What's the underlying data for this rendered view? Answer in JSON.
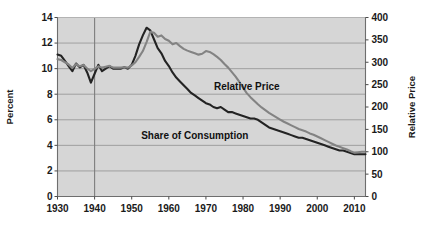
{
  "chart_data": {
    "type": "line",
    "title": "",
    "subtitle": "",
    "xlabel": "",
    "ylabel": "Percent",
    "y2label": "Relative Price",
    "xlim": [
      1930,
      2013
    ],
    "ylim": [
      0,
      14
    ],
    "y2lim": [
      0,
      400
    ],
    "grid": true,
    "legend_position": "inline-annotation",
    "background_color": "#d6d6d6",
    "plot_border_color": "#8c8c8c",
    "gridline_color": "#9a9a9a",
    "xticks": [
      1930,
      1940,
      1950,
      1960,
      1970,
      1980,
      1990,
      2000,
      2010
    ],
    "xtick_labels": [
      "1930",
      "1940",
      "1950",
      "1960",
      "1970",
      "1980",
      "1990",
      "2000",
      "2010"
    ],
    "yticks": [
      0,
      2,
      4,
      6,
      8,
      10,
      12,
      14
    ],
    "ytick_labels": [
      "0",
      "2",
      "4",
      "6",
      "8",
      "10",
      "12",
      "14"
    ],
    "y2ticks": [
      0,
      50,
      100,
      150,
      200,
      250,
      300,
      350,
      400
    ],
    "y2tick_labels": [
      "0",
      "50",
      "100",
      "150",
      "200",
      "250",
      "300",
      "350",
      "400"
    ],
    "annotations": [
      {
        "text": "Relative Price",
        "x": 1981,
        "y": 8.35,
        "color": "#111111"
      },
      {
        "text": "Share of Consumption",
        "x": 1967,
        "y": 4.5,
        "color": "#111111"
      }
    ],
    "series": [
      {
        "name": "Share of Consumption",
        "axis": "left",
        "color": "#232323",
        "width": 2.1,
        "x": [
          1930,
          1931,
          1932,
          1933,
          1934,
          1935,
          1936,
          1937,
          1938,
          1939,
          1940,
          1941,
          1942,
          1943,
          1944,
          1945,
          1946,
          1947,
          1948,
          1949,
          1950,
          1951,
          1952,
          1953,
          1954,
          1955,
          1956,
          1957,
          1958,
          1959,
          1960,
          1961,
          1962,
          1963,
          1964,
          1965,
          1966,
          1967,
          1968,
          1969,
          1970,
          1971,
          1972,
          1973,
          1974,
          1975,
          1976,
          1977,
          1978,
          1979,
          1980,
          1981,
          1982,
          1983,
          1984,
          1985,
          1986,
          1987,
          1988,
          1989,
          1990,
          1991,
          1992,
          1993,
          1994,
          1995,
          1996,
          1997,
          1998,
          1999,
          2000,
          2001,
          2002,
          2003,
          2004,
          2005,
          2006,
          2007,
          2008,
          2009,
          2010,
          2011,
          2012,
          2013
        ],
        "values": [
          11.1,
          11.0,
          10.6,
          10.2,
          9.8,
          10.4,
          10.1,
          10.3,
          9.7,
          8.9,
          9.6,
          10.3,
          9.8,
          10.0,
          10.2,
          10.0,
          10.0,
          10.0,
          10.1,
          10.0,
          10.3,
          11.0,
          11.9,
          12.6,
          13.2,
          13.0,
          12.3,
          11.6,
          11.2,
          10.6,
          10.2,
          9.7,
          9.3,
          9.0,
          8.7,
          8.4,
          8.1,
          7.9,
          7.7,
          7.5,
          7.3,
          7.2,
          7.0,
          6.9,
          7.0,
          6.8,
          6.6,
          6.6,
          6.5,
          6.4,
          6.3,
          6.2,
          6.1,
          6.1,
          6.0,
          5.8,
          5.6,
          5.4,
          5.3,
          5.2,
          5.1,
          5.0,
          4.9,
          4.8,
          4.7,
          4.6,
          4.6,
          4.5,
          4.4,
          4.3,
          4.2,
          4.1,
          4.0,
          3.9,
          3.8,
          3.7,
          3.6,
          3.6,
          3.5,
          3.4,
          3.3,
          3.3,
          3.3,
          3.3
        ]
      },
      {
        "name": "Relative Price",
        "axis": "right",
        "color": "#838383",
        "width": 2.1,
        "x": [
          1930,
          1931,
          1932,
          1933,
          1934,
          1935,
          1936,
          1937,
          1938,
          1939,
          1940,
          1941,
          1942,
          1943,
          1944,
          1945,
          1946,
          1947,
          1948,
          1949,
          1950,
          1951,
          1952,
          1953,
          1954,
          1955,
          1956,
          1957,
          1958,
          1959,
          1960,
          1961,
          1962,
          1963,
          1964,
          1965,
          1966,
          1967,
          1968,
          1969,
          1970,
          1971,
          1972,
          1973,
          1974,
          1975,
          1976,
          1977,
          1978,
          1979,
          1980,
          1981,
          1982,
          1983,
          1984,
          1985,
          1986,
          1987,
          1988,
          1989,
          1990,
          1991,
          1992,
          1993,
          1994,
          1995,
          1996,
          1997,
          1998,
          1999,
          2000,
          2001,
          2002,
          2003,
          2004,
          2005,
          2006,
          2007,
          2008,
          2009,
          2010,
          2011,
          2012,
          2013
        ],
        "values": [
          307,
          305,
          300,
          295,
          287,
          296,
          291,
          294,
          286,
          280,
          285,
          291,
          288,
          290,
          292,
          288,
          288,
          288,
          289,
          288,
          293,
          300,
          312,
          325,
          345,
          368,
          366,
          357,
          360,
          352,
          348,
          340,
          343,
          336,
          330,
          326,
          323,
          320,
          317,
          319,
          325,
          323,
          318,
          312,
          305,
          296,
          288,
          278,
          268,
          256,
          243,
          231,
          222,
          214,
          206,
          199,
          193,
          187,
          182,
          177,
          172,
          167,
          163,
          159,
          155,
          151,
          148,
          145,
          141,
          138,
          134,
          130,
          126,
          122,
          118,
          114,
          111,
          108,
          105,
          101,
          98,
          99,
          100,
          100
        ]
      }
    ]
  },
  "axes": {
    "left_title": "Percent",
    "right_title": "Relative Price"
  }
}
